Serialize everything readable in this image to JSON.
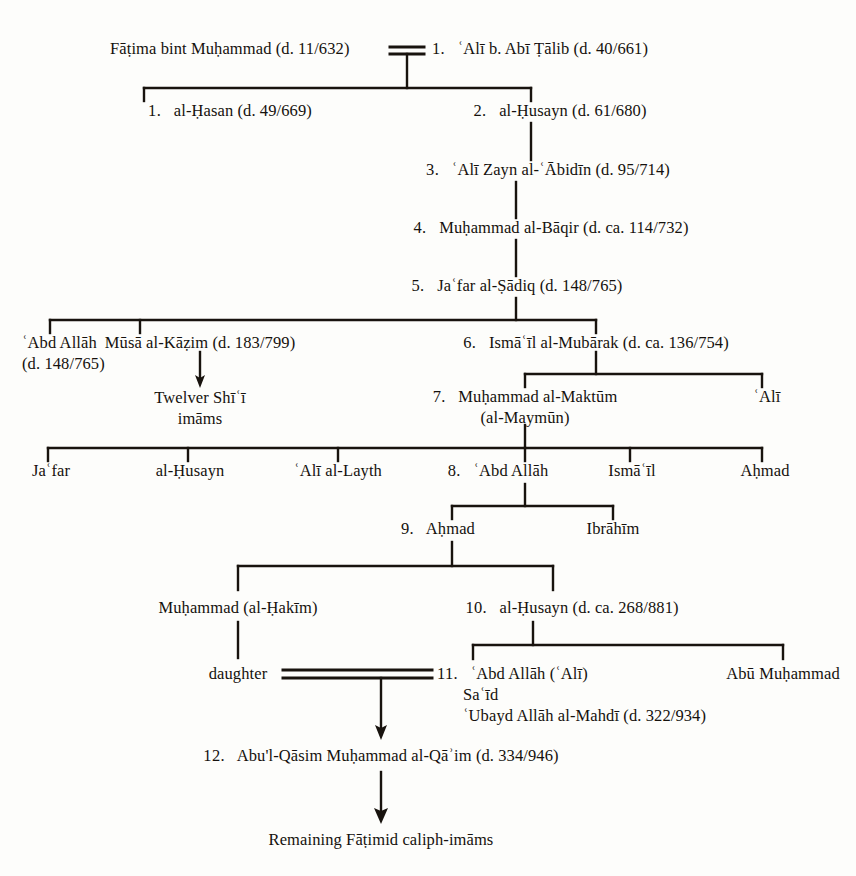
{
  "figure": {
    "type": "genealogical-tree",
    "title_visible": false,
    "background_color": "#fdfdfb",
    "line_color": "#18130e",
    "text_color": "#15110d"
  },
  "nodes": {
    "fatima": {
      "label": "Fāṭima bint Muḥammad (d. 11/632)"
    },
    "ali_abi_talib": {
      "num": "1.",
      "label": "ʿAlī b. Abī Ṭālib (d. 40/661)"
    },
    "hasan": {
      "num": "1.",
      "label": "al-Ḥasan (d. 49/669)"
    },
    "husayn": {
      "num": "2.",
      "label": "al-Ḥusayn (d. 61/680)"
    },
    "zayn_al_abidin": {
      "num": "3.",
      "label": "ʿAlī Zayn al-ʿĀbidīn (d. 95/714)"
    },
    "al_baqir": {
      "num": "4.",
      "label": "Muḥammad al-Bāqir (d. ca. 114/732)"
    },
    "al_sadiq": {
      "num": "5.",
      "label": "Jaʿfar al-Ṣādiq (d. 148/765)"
    },
    "abd_allah_148": {
      "label": "ʿAbd Allāh",
      "line2": "(d. 148/765)"
    },
    "musa_al_kazim": {
      "label": "Mūsā al-Kāẓim (d. 183/799)"
    },
    "twelver_imams": {
      "label": "Twelver Shīʿī",
      "line2": "imāms"
    },
    "ismail_al_mubarak": {
      "num": "6.",
      "label": "Ismāʿīl al-Mubārak (d. ca. 136/754)"
    },
    "muhammad_al_maktum": {
      "num": "7.",
      "label": "Muḥammad al-Maktūm",
      "line2": "(al-Maymūn)"
    },
    "ali_son_of_ismail": {
      "label": "ʿAlī"
    },
    "jafar": {
      "label": "Jaʿfar"
    },
    "al_husayn_2": {
      "label": "al-Ḥusayn"
    },
    "ali_al_layth": {
      "label": "ʿAlī al-Layth"
    },
    "abd_allah_8": {
      "num": "8.",
      "label": "ʿAbd Allāh"
    },
    "ismail_2": {
      "label": "Ismāʿīl"
    },
    "ahmad_right": {
      "label": "Aḥmad"
    },
    "ahmad_9": {
      "num": "9.",
      "label": "Aḥmad"
    },
    "ibrahim": {
      "label": "Ibrāhīm"
    },
    "muhammad_al_hakim": {
      "label": "Muḥammad (al-Ḥakīm)"
    },
    "al_husayn_10": {
      "num": "10.",
      "label": "al-Ḥusayn (d. ca. 268/881)"
    },
    "daughter": {
      "label": "daughter"
    },
    "abd_allah_11": {
      "num": "11.",
      "label": "ʿAbd Allāh (ʿAlī)",
      "line2": "Saʿīd",
      "line3": "ʿUbayd Allāh al-Mahdī (d. 322/934)"
    },
    "abu_muhammad": {
      "label": "Abū Muḥammad"
    },
    "al_qaim": {
      "num": "12.",
      "label": "Abu'l-Qāsim Muḥammad al-Qāʾim (d. 334/946)"
    },
    "remaining_fatimid": {
      "label": "Remaining Fāṭimid caliph-imāms"
    }
  }
}
